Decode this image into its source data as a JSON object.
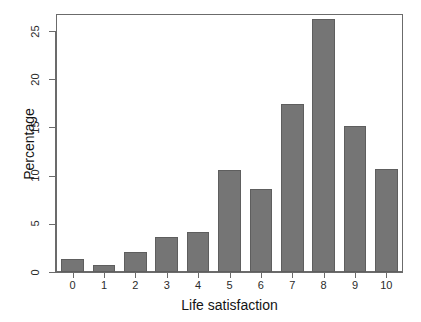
{
  "chart_data": {
    "type": "bar",
    "title": "",
    "subtitle": "",
    "xlabel": "Life satisfaction",
    "ylabel": "Percentage",
    "categories": [
      "0",
      "1",
      "2",
      "3",
      "4",
      "5",
      "6",
      "7",
      "8",
      "9",
      "10"
    ],
    "values": [
      1.3,
      0.7,
      2.1,
      3.6,
      4.2,
      10.6,
      8.6,
      17.4,
      26.2,
      15.1,
      10.7
    ],
    "xtick_labels": [
      "0",
      "1",
      "2",
      "3",
      "4",
      "5",
      "6",
      "7",
      "8",
      "9",
      "10"
    ],
    "ytick_labels": [
      "0",
      "5",
      "10",
      "15",
      "20",
      "25"
    ],
    "ytick_values": [
      0,
      5,
      10,
      15,
      20,
      25
    ],
    "ylim": [
      0,
      26.8
    ],
    "grid": false,
    "legend": null,
    "legend_position": "none",
    "bar_color": "#757575",
    "bar_edge_color": "#5e5e5e",
    "axis_color": "#6b6b6b",
    "text_color": "#141414",
    "background": "#ffffff"
  }
}
